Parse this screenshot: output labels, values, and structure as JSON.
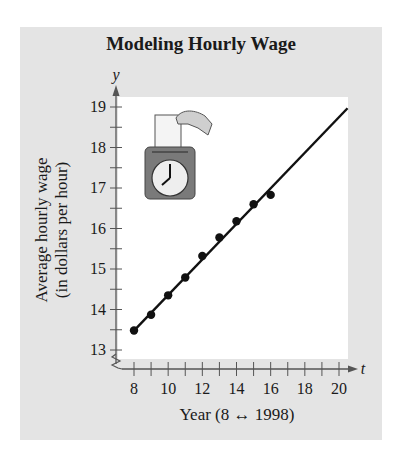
{
  "chart_data": {
    "type": "scatter",
    "title": "Modeling Hourly Wage",
    "xlabel": "Year (8 ↔ 1998)",
    "ylabel_line1": "Average hourly wage",
    "ylabel_line2": "(in dollars per hour)",
    "x_var": "t",
    "y_var": "y",
    "xlim": [
      8,
      20
    ],
    "ylim": [
      13,
      19
    ],
    "x_ticks": [
      8,
      10,
      12,
      14,
      16,
      18,
      20
    ],
    "y_ticks": [
      13,
      14,
      15,
      16,
      17,
      18,
      19
    ],
    "axis_breaks": true,
    "grid": false,
    "legend": null,
    "series": [
      {
        "name": "Average hourly wage (data)",
        "kind": "points",
        "x": [
          8,
          9,
          10,
          11,
          12,
          13,
          14,
          15,
          16
        ],
        "y": [
          13.48,
          13.87,
          14.35,
          14.79,
          15.32,
          15.78,
          16.18,
          16.6,
          16.83
        ]
      },
      {
        "name": "Linear model",
        "kind": "line",
        "x": [
          8,
          20.5
        ],
        "y": [
          13.48,
          18.97
        ]
      }
    ],
    "illustration": "time-clock-with-card"
  }
}
